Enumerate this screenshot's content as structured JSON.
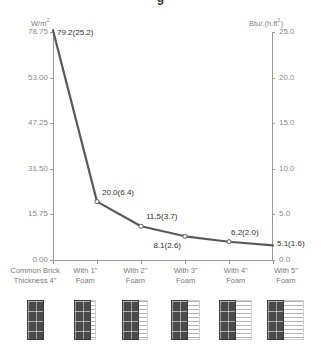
{
  "title_sliver": "g",
  "axes": {
    "left_unit": "W/m",
    "left_unit_sup": "2",
    "right_unit": "Btu/.(h.ft",
    "right_unit_sup": "2",
    "right_unit_tail": ")",
    "left_ticks": [
      "78.75",
      "53.00",
      "47.25",
      "31.50",
      "15.75",
      "0.00"
    ],
    "right_ticks": [
      "25.0",
      "20.0",
      "15.0",
      "10.0",
      "5.0",
      "0.0"
    ]
  },
  "chart_data": {
    "type": "line",
    "title": "",
    "xlabel": "",
    "ylabel": "W/m2",
    "y2label": "Btu/(h.ft2)",
    "categories": [
      "Common Brick\nThickness 4\"",
      "With 1\"\nFoam",
      "With 2\"\nFoam",
      "With 3\"\nFoam",
      "With 4\"\nFoam",
      "With 5\"\nFoam"
    ],
    "values": [
      79.2,
      20.0,
      11.5,
      8.1,
      6.2,
      5.1
    ],
    "values_imperial": [
      25.2,
      6.4,
      3.7,
      2.6,
      2.0,
      1.6
    ],
    "point_labels": [
      "79.2(25.2)",
      "20.0(6.4)",
      "11.5(3.7)",
      "8.1(2.6)",
      "6.2(2.0)",
      "5.1(1.6)"
    ],
    "ylim": [
      0,
      78.75
    ],
    "y2lim": [
      0,
      25.0
    ],
    "grid": false,
    "legend": "none",
    "series_color": "#595959",
    "marker": "open-circle"
  },
  "swatches": [
    {
      "name": "wall-common-brick",
      "brick_width": 17,
      "foam_width": 0
    },
    {
      "name": "wall-foam-1in",
      "brick_width": 17,
      "foam_width": 5
    },
    {
      "name": "wall-foam-2in",
      "brick_width": 17,
      "foam_width": 9
    },
    {
      "name": "wall-foam-3in",
      "brick_width": 17,
      "foam_width": 12
    },
    {
      "name": "wall-foam-4in",
      "brick_width": 17,
      "foam_width": 16
    },
    {
      "name": "wall-foam-5in",
      "brick_width": 17,
      "foam_width": 20
    }
  ]
}
